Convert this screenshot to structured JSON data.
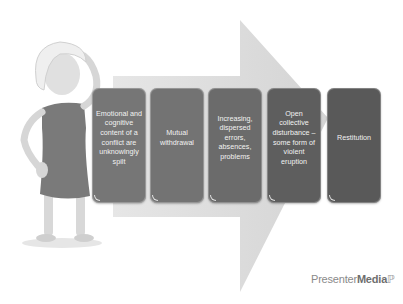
{
  "diagram": {
    "steps": [
      {
        "label": "Emotional and cognitive content of a conflict are unknowingly spilt",
        "color": "#767676"
      },
      {
        "label": "Mutual withdrawal",
        "color": "#737373"
      },
      {
        "label": "Increasing, dispersed errors, absences, problems",
        "color": "#6b6b6b"
      },
      {
        "label": "Open collective disturbance – some form of violent eruption",
        "color": "#5e5e5e"
      },
      {
        "label": "Restitution",
        "color": "#595959"
      }
    ],
    "arrow_color": "#dcdcdc",
    "figure": "confused-stick-figure-woman"
  },
  "branding": {
    "logo_part1": "Presenter",
    "logo_part2": "Media"
  }
}
